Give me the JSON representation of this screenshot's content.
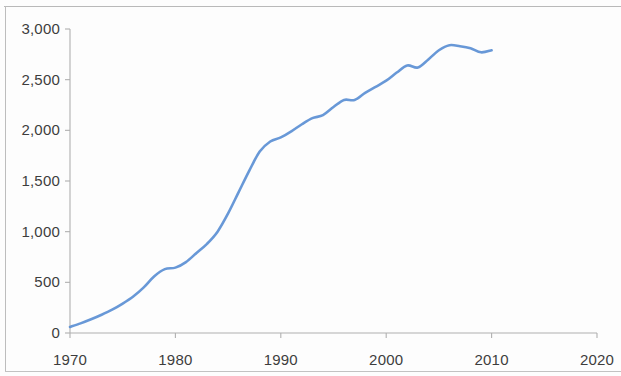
{
  "chart_data": {
    "type": "line",
    "title": "",
    "subtitle": "",
    "xlabel": "",
    "ylabel": "",
    "xlim": [
      1970,
      2020
    ],
    "ylim": [
      0,
      3000
    ],
    "grid": false,
    "legend": false,
    "legend_position": "none",
    "x_ticks": [
      "1970",
      "1980",
      "1990",
      "2000",
      "2010",
      "2020"
    ],
    "y_ticks": [
      "0",
      "500",
      "1,000",
      "1,500",
      "2,000",
      "2,500",
      "3,000"
    ],
    "series": [
      {
        "name": "series-1",
        "color": "#5b8fd4",
        "x": [
          1970,
          1971,
          1972,
          1973,
          1974,
          1975,
          1976,
          1977,
          1978,
          1979,
          1980,
          1981,
          1982,
          1983,
          1984,
          1985,
          1986,
          1987,
          1988,
          1989,
          1990,
          1991,
          1992,
          1993,
          1994,
          1995,
          1996,
          1997,
          1998,
          1999,
          2000,
          2001,
          2002,
          2003,
          2004,
          2005,
          2006,
          2007,
          2008,
          2009,
          2010
        ],
        "values": [
          60,
          95,
          135,
          180,
          230,
          290,
          360,
          450,
          560,
          630,
          645,
          700,
          790,
          880,
          1000,
          1180,
          1390,
          1600,
          1790,
          1890,
          1930,
          1990,
          2060,
          2120,
          2150,
          2230,
          2300,
          2300,
          2370,
          2430,
          2490,
          2570,
          2640,
          2620,
          2700,
          2790,
          2840,
          2830,
          2810,
          2770,
          2790
        ]
      }
    ]
  },
  "axis": {
    "x_tick_values": [
      1970,
      1980,
      1990,
      2000,
      2010,
      2020
    ],
    "y_tick_values": [
      0,
      500,
      1000,
      1500,
      2000,
      2500,
      3000
    ]
  },
  "style": {
    "line_color": "#5b8fd4",
    "axis_color": "#b0b0b0",
    "tick_text_color": "#3d3d3d",
    "background": "#fdfdfd",
    "frame_color": "#bdbdbd"
  }
}
